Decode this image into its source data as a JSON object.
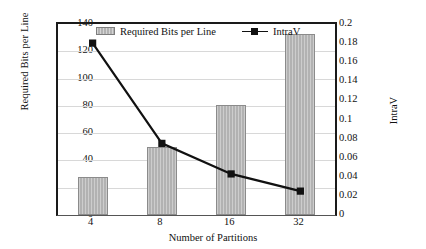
{
  "chart_data": {
    "type": "bar",
    "title": "",
    "xlabel": "Number of Partitions",
    "ylabel": "Required Bits per Line",
    "y2label": "IntraV",
    "categories": [
      "4",
      "8",
      "16",
      "32"
    ],
    "grid": true,
    "legend_position": "top-center",
    "ylim": [
      0,
      140
    ],
    "yticks": [
      "0",
      "20",
      "40",
      "60",
      "80",
      "100",
      "120",
      "140"
    ],
    "y2lim": [
      0,
      0.2
    ],
    "y2ticks": [
      "0",
      "0.02",
      "0.04",
      "0.06",
      "0.08",
      "0.1",
      "0.12",
      "0.14",
      "0.16",
      "0.18",
      "0.2"
    ],
    "series": [
      {
        "name": "Required Bits per Line",
        "kind": "bar",
        "axis": "left",
        "color": "#b2b2b2",
        "edge_color": "#8b8b8b",
        "values": [
          28,
          50,
          81,
          133
        ]
      },
      {
        "name": "IntraV",
        "kind": "line",
        "axis": "right",
        "color": "#111111",
        "marker": "square",
        "values": [
          0.18,
          0.075,
          0.043,
          0.025
        ]
      }
    ]
  },
  "legend": {
    "entries": [
      {
        "label": "Required Bits per Line",
        "swatch": "bar-swatch"
      },
      {
        "label": "IntraV",
        "swatch": "line-marker-swatch"
      }
    ]
  }
}
